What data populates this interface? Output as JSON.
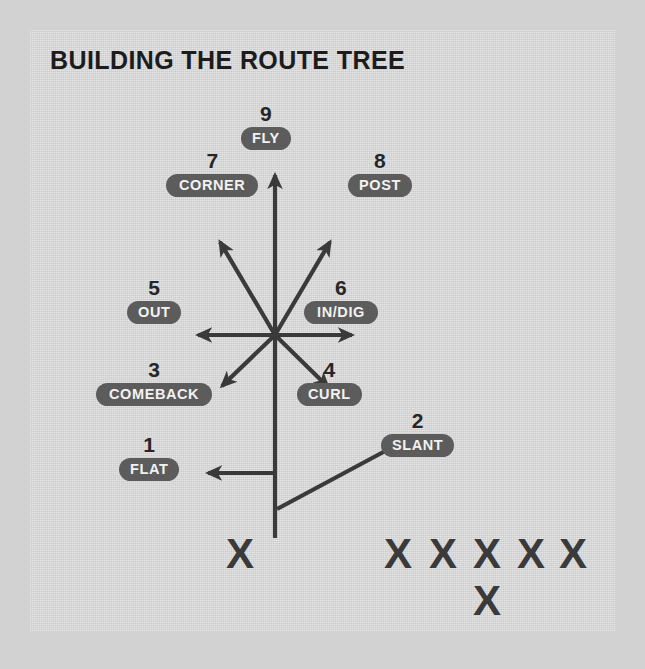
{
  "title": "BUILDING THE ROUTE TREE",
  "colors": {
    "page_background": "#d2d2d2",
    "panel_background": "#d9d9d9",
    "ink": "#3a3a3a",
    "pill_background": "#5c5c5c",
    "pill_text": "#f2f2f2",
    "number_text": "#262626",
    "title_text": "#1c1c1c"
  },
  "routes": [
    {
      "number": "1",
      "name": "FLAT",
      "x": 143,
      "y": 415,
      "direction": "left"
    },
    {
      "number": "2",
      "name": "SLANT",
      "x": 417,
      "y": 390,
      "direction": "up-right-shallow"
    },
    {
      "number": "3",
      "name": "COMEBACK",
      "x": 155,
      "y": 340,
      "direction": "down-left"
    },
    {
      "number": "4",
      "name": "CURL",
      "x": 331,
      "y": 340,
      "direction": "down-right"
    },
    {
      "number": "5",
      "name": "OUT",
      "x": 152,
      "y": 258,
      "direction": "left"
    },
    {
      "number": "6",
      "name": "IN/DIG",
      "x": 346,
      "y": 258,
      "direction": "right"
    },
    {
      "number": "7",
      "name": "CORNER",
      "x": 136,
      "y": 120,
      "direction": "up-left"
    },
    {
      "number": "8",
      "name": "POST",
      "x": 346,
      "y": 120,
      "direction": "up-right"
    },
    {
      "number": "9",
      "name": "FLY",
      "x": 245,
      "y": 73,
      "direction": "up"
    }
  ],
  "formation": {
    "marker_glyph": "X",
    "receiver": {
      "label": "X",
      "x": 240,
      "y": 553
    },
    "line_of_scrimmage": [
      {
        "label": "X",
        "x": 398,
        "y": 553
      },
      {
        "label": "X",
        "x": 443,
        "y": 553
      },
      {
        "label": "X",
        "x": 487,
        "y": 553
      },
      {
        "label": "X",
        "x": 531,
        "y": 553
      },
      {
        "label": "X",
        "x": 573,
        "y": 553
      }
    ],
    "quarterback": {
      "label": "X",
      "x": 487,
      "y": 600
    }
  },
  "hub": {
    "x": 245,
    "y": 305
  }
}
